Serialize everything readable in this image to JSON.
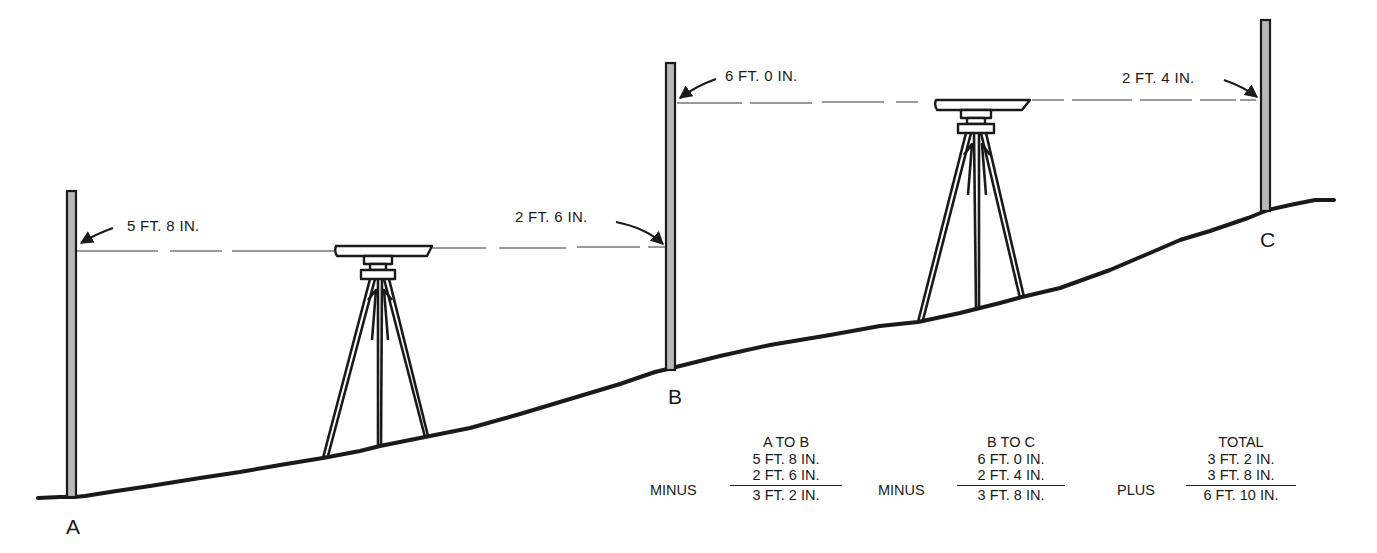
{
  "diagram": {
    "points": [
      {
        "id": "A",
        "label": "A"
      },
      {
        "id": "B",
        "label": "B"
      },
      {
        "id": "C",
        "label": "C"
      }
    ],
    "readings": [
      {
        "id": "a-backsight",
        "label": "5 FT. 8 IN."
      },
      {
        "id": "b-foresight",
        "label": "2 FT. 6 IN."
      },
      {
        "id": "b-backsight",
        "label": "6 FT. 0 IN."
      },
      {
        "id": "c-foresight",
        "label": "2 FT. 4 IN."
      }
    ],
    "instruments": [
      {
        "id": "level-1",
        "icon": "tripod-level-icon"
      },
      {
        "id": "level-2",
        "icon": "tripod-level-icon"
      }
    ],
    "colors": {
      "ink": "#1a1a1a",
      "sight_line": "#9a9a9a",
      "rod_fill": "#b8b8b8"
    }
  },
  "calculations": [
    {
      "id": "a-to-b",
      "heading": "A TO B",
      "operator": "MINUS",
      "line1": "5 FT. 8 IN.",
      "line2": "2 FT. 6 IN.",
      "result": "3 FT. 2 IN."
    },
    {
      "id": "b-to-c",
      "heading": "B TO C",
      "operator": "MINUS",
      "line1": "6 FT. 0 IN.",
      "line2": "2 FT. 4 IN.",
      "result": "3 FT. 8 IN."
    },
    {
      "id": "total",
      "heading": "TOTAL",
      "operator": "PLUS",
      "line1": "3 FT. 2 IN.",
      "line2": "3 FT. 8 IN.",
      "result": "6 FT. 10 IN."
    }
  ]
}
